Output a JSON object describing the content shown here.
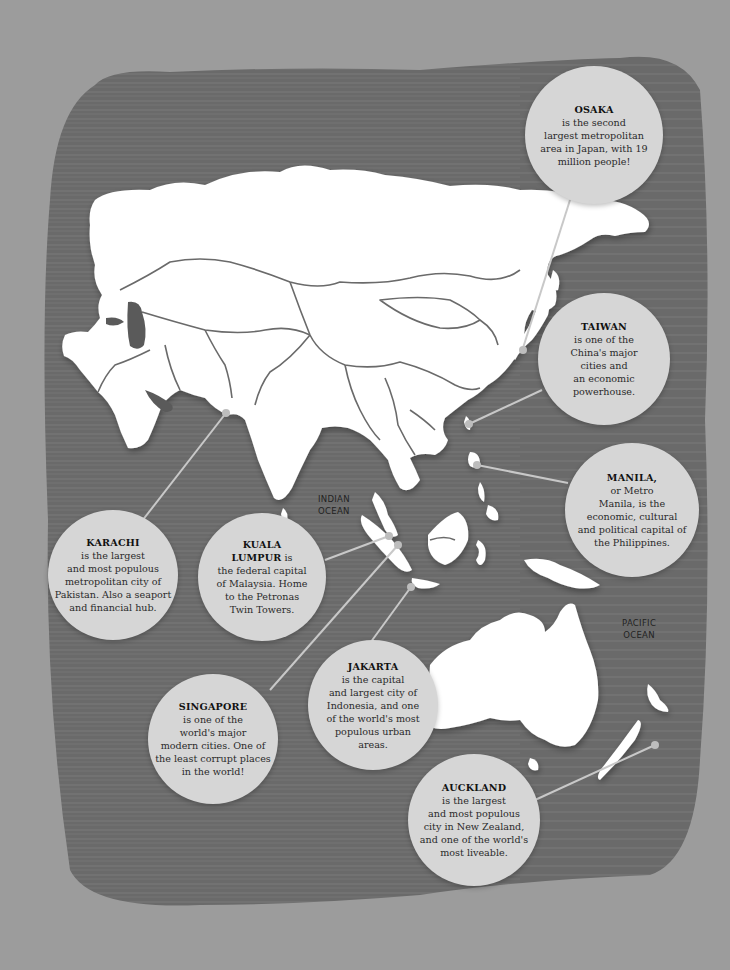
{
  "map": {
    "region": "Asia and Oceania",
    "colors": {
      "page_background": "#9c9c9c",
      "sea_board": "#6a6a6a",
      "land": "#ffffff",
      "borders": "#6a6a6a",
      "callout_fill": "#d6d6d6",
      "connector_line": "#c8c8c8"
    },
    "ocean_labels": [
      {
        "line1": "INDIAN",
        "line2": "OCEAN"
      },
      {
        "line1": "PACIFIC",
        "line2": "OCEAN"
      }
    ],
    "callouts": [
      {
        "city": "OSAKA",
        "lines": [
          "is the second",
          "largest metropolitan",
          "area in Japan, with 19",
          "million people!"
        ]
      },
      {
        "city": "TAIWAN",
        "lines": [
          "is one of the",
          "China's major",
          "cities and",
          "an economic",
          "powerhouse."
        ]
      },
      {
        "city": "MANILA,",
        "lines": [
          "or Metro",
          "Manila, is the",
          "economic, cultural",
          "and political capital of",
          "the Philippines."
        ]
      },
      {
        "city": "KARACHI",
        "lines": [
          "is the largest",
          "and most populous",
          "metropolitan city of",
          "Pakistan. Also a seaport",
          "and financial hub."
        ]
      },
      {
        "city_line1": "KUALA",
        "city_line2": "LUMPUR",
        "city_suffix": " is",
        "lines": [
          "the federal capital",
          "of Malaysia. Home",
          "to the Petronas",
          "Twin Towers."
        ]
      },
      {
        "city": "JAKARTA",
        "lines": [
          "is the capital",
          "and largest city of",
          "Indonesia, and one",
          "of the world's most",
          "populous urban",
          "areas."
        ]
      },
      {
        "city": "SINGAPORE",
        "lines": [
          "is one of the",
          "world's major",
          "modern cities. One of",
          "the least corrupt places",
          "in the world!"
        ]
      },
      {
        "city": "AUCKLAND",
        "lines": [
          "is the largest",
          "and most populous",
          "city in New Zealand,",
          "and one of the world's",
          "most liveable."
        ]
      }
    ]
  }
}
